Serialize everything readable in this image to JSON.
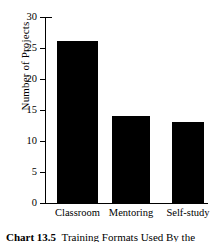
{
  "chart_data": {
    "type": "bar",
    "title": "",
    "xlabel": "",
    "ylabel": "Number of Projects",
    "categories": [
      "Classroom",
      "Mentoring",
      "Self-study"
    ],
    "values": [
      26,
      14,
      13
    ],
    "ylim": [
      0,
      30
    ],
    "yticks": [
      0,
      5,
      10,
      15,
      20,
      25,
      30
    ],
    "ytick_labels": [
      "0",
      "5",
      "10",
      "15",
      "20",
      "25",
      "30"
    ],
    "grid": false,
    "legend": false,
    "bar_color": "#000000",
    "background_color": "#ffffff",
    "orientation": "vertical"
  },
  "caption": {
    "label": "Chart 13.5",
    "text": "Training Formats Used By the",
    "visible_note": "clipped at bottom edge"
  }
}
